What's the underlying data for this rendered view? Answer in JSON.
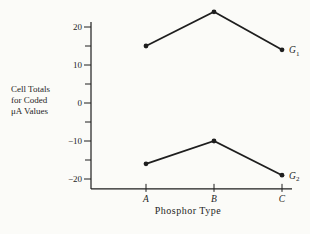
{
  "figure": {
    "background": "#fbfbf8",
    "ink": "#1e1e1e"
  },
  "chart_data": {
    "type": "line",
    "title": "",
    "ylabel_lines": [
      "Cell Totals",
      "for Coded",
      "μA Values"
    ],
    "xlabel": "Phosphor Type",
    "categories": [
      "A",
      "B",
      "C"
    ],
    "series": [
      {
        "name": "G",
        "subscript": "1",
        "values": [
          15,
          24,
          14
        ]
      },
      {
        "name": "G",
        "subscript": "2",
        "values": [
          -16,
          -10,
          -19
        ]
      }
    ],
    "y_major_ticks": [
      20,
      10,
      0,
      -10,
      -20
    ],
    "y_minor_ticks": [
      15,
      5,
      -5,
      -15
    ],
    "ylim": [
      -22.6,
      21.3
    ],
    "grid": false,
    "marker": "dot",
    "line_color": "#1e1e1e",
    "legend_position": "right-of-last-point"
  }
}
